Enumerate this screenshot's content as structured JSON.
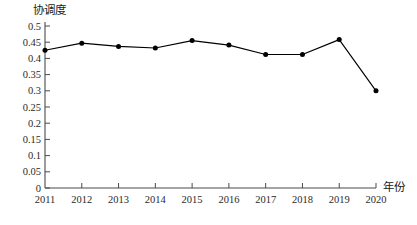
{
  "chart_data": {
    "type": "line",
    "title": "",
    "xlabel": "年份",
    "ylabel": "协调度",
    "categories": [
      "2011",
      "2012",
      "2013",
      "2014",
      "2015",
      "2016",
      "2017",
      "2018",
      "2019",
      "2020"
    ],
    "values": [
      0.425,
      0.447,
      0.437,
      0.432,
      0.455,
      0.441,
      0.412,
      0.412,
      0.458,
      0.3
    ],
    "series": [
      {
        "name": "协调度",
        "values": [
          0.425,
          0.447,
          0.437,
          0.432,
          0.455,
          0.441,
          0.412,
          0.412,
          0.458,
          0.3
        ]
      }
    ],
    "ylim": [
      0,
      0.5
    ],
    "ytick_labels": [
      "0",
      "0.05",
      "0.1",
      "0.15",
      "0.2",
      "0.25",
      "0.3",
      "0.35",
      "0.4",
      "0.45",
      "0.5"
    ],
    "ytick_values": [
      0,
      0.05,
      0.1,
      0.15,
      0.2,
      0.25,
      0.3,
      0.35,
      0.4,
      0.45,
      0.5
    ],
    "xtick_labels": [
      "2011",
      "2012",
      "2013",
      "2014",
      "2015",
      "2016",
      "2017",
      "2018",
      "2019",
      "2020"
    ],
    "grid": false,
    "legend": false,
    "marker": "filled-circle",
    "line_color": "#000000",
    "marker_color": "#000000",
    "axis_color": "#4a4a4a"
  }
}
